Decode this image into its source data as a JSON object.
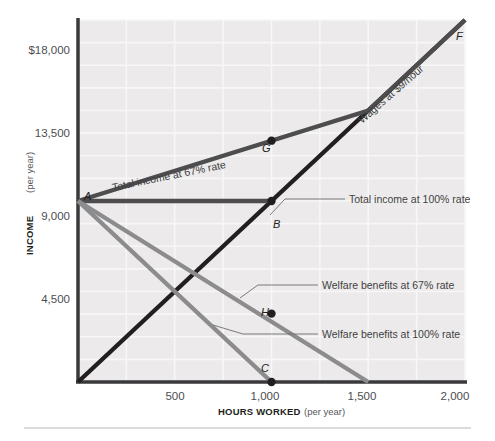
{
  "chart_data": {
    "type": "line",
    "title": "",
    "xlabel": "HOURS WORKED",
    "xlabel_sub": "(per year)",
    "ylabel": "INCOME",
    "ylabel_sub": "(per year)",
    "xlim": [
      0,
      2000
    ],
    "ylim": [
      0,
      18000
    ],
    "xticks": [
      500,
      1000,
      1500,
      2000
    ],
    "xtick_labels": [
      "500",
      "1,000",
      "1,500",
      "2,000"
    ],
    "yticks": [
      4500,
      9000,
      13500,
      18000
    ],
    "ytick_labels": [
      "4,500",
      "9,000",
      "13,500",
      "$18,000"
    ],
    "grid": true,
    "grid_x_step": 250,
    "grid_y_step": 1125,
    "legend": "inline-labels",
    "series": [
      {
        "name": "Wages at $9/hour",
        "label": "Wages at $9/hour",
        "color": "#231f20",
        "width": 4.4,
        "points": [
          [
            0,
            0
          ],
          [
            2000,
            18000
          ]
        ]
      },
      {
        "name": "Total income at 67% rate",
        "label": "Total income at 67% rate",
        "color": "#4d4d4f",
        "width": 4.4,
        "points": [
          [
            0,
            9000
          ],
          [
            1500,
            13500
          ],
          [
            2000,
            18000
          ]
        ]
      },
      {
        "name": "Total income at 100% rate",
        "label": "Total income at 100% rate",
        "color": "#4d4d4f",
        "width": 4.4,
        "points": [
          [
            0,
            9000
          ],
          [
            1000,
            9000
          ]
        ]
      },
      {
        "name": "Welfare benefits at 67% rate",
        "label": "Welfare benefits at 67% rate",
        "color": "#8c8c8e",
        "width": 4.4,
        "points": [
          [
            0,
            9000
          ],
          [
            1500,
            0
          ]
        ]
      },
      {
        "name": "Welfare benefits at 100% rate",
        "label": "Welfare benefits at 100% rate",
        "color": "#8c8c8e",
        "width": 4.4,
        "points": [
          [
            0,
            9000
          ],
          [
            1000,
            0
          ]
        ]
      }
    ],
    "annotations": [
      {
        "label": "A",
        "x": 0,
        "y": 9000,
        "dot": false
      },
      {
        "label": "B",
        "x": 1000,
        "y": 9000,
        "dot": true
      },
      {
        "label": "C",
        "x": 1000,
        "y": 0,
        "dot": true
      },
      {
        "label": "F",
        "x": 2000,
        "y": 18000,
        "dot": false
      },
      {
        "label": "G",
        "x": 1000,
        "y": 12000,
        "dot": true
      },
      {
        "label": "H",
        "x": 1000,
        "y": 3400,
        "dot": true
      }
    ]
  },
  "colors": {
    "plot_background": "#eceaea",
    "gridline": "#f7f7f7",
    "axis": "#3a3a3c",
    "page_background": "#ffffff",
    "rule": "#b7b7ba"
  }
}
